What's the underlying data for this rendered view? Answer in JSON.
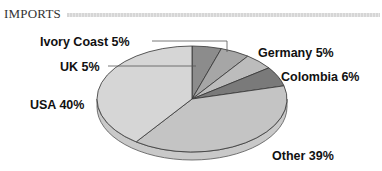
{
  "header": {
    "title": "IMPORTS"
  },
  "chart_data": {
    "type": "pie",
    "title": "IMPORTS",
    "style": "3d",
    "categories": [
      "UK",
      "Ivory Coast",
      "Germany",
      "Colombia",
      "Other",
      "USA"
    ],
    "values": [
      5,
      5,
      5,
      6,
      39,
      40
    ],
    "labels": [
      "UK 5%",
      "Ivory Coast 5%",
      "Germany 5%",
      "Colombia 6%",
      "Other 39%",
      "USA 40%"
    ],
    "colors": [
      "#8c8c8c",
      "#a6a6a6",
      "#bcbcbc",
      "#7a7a7a",
      "#c4c4c4",
      "#d6d6d6"
    ],
    "start_angle": "12 o'clock",
    "direction": "clockwise",
    "legend": "none"
  },
  "labels": {
    "uk": "UK 5%",
    "ivory_coast": "Ivory Coast 5%",
    "germany": "Germany 5%",
    "colombia": "Colombia 6%",
    "other": "Other 39%",
    "usa": "USA 40%"
  }
}
